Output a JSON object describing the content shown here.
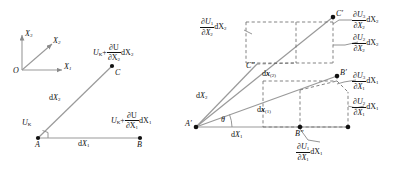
{
  "figure": {
    "background_color": "#ffffff",
    "line_color": "#808080",
    "dash_color": "#555555",
    "text_color": "#111111"
  },
  "axes": {
    "origin_label": "O",
    "x1_label": "X",
    "x1_sub": "1",
    "x2_label": "X",
    "x2_sub": "2",
    "x3_label": "X",
    "x3_sub": "3"
  },
  "left_diagram": {
    "points": [
      {
        "name": "point-a",
        "label": "A",
        "x": 38,
        "y": 138
      },
      {
        "name": "point-b",
        "label": "B",
        "x": 140,
        "y": 138
      },
      {
        "name": "point-c",
        "label": "C",
        "x": 112,
        "y": 66
      }
    ],
    "edges": [
      {
        "name": "edge-ab",
        "label_prefix": "d",
        "label_var": "X",
        "label_sub": "1"
      },
      {
        "name": "edge-ac",
        "label_prefix": "d",
        "label_var": "X",
        "label_sub": "2"
      }
    ],
    "displacement_at_a": {
      "var": "U",
      "sub": "K"
    },
    "displacement_at_c": {
      "base_var": "U",
      "base_sub": "K",
      "plus": "+",
      "num_top": "∂U",
      "num_bottom": "∂X",
      "num_bottom_sub": "2",
      "tail": "dX",
      "tail_sub": "2"
    },
    "displacement_at_b": {
      "base_var": "U",
      "base_sub": "K",
      "plus": "+",
      "num_top": "∂U",
      "num_bottom": "∂X",
      "num_bottom_sub": "1",
      "tail": "dX",
      "tail_sub": "1"
    },
    "right_angle_marker": true
  },
  "right_diagram": {
    "points": [
      {
        "name": "point-a-prime",
        "label": "A′",
        "x": 196,
        "y": 127
      },
      {
        "name": "point-b-prime",
        "label": "B′",
        "x": 337,
        "y": 76
      },
      {
        "name": "point-b-double-prime",
        "label": "B″",
        "x": 300,
        "y": 128
      },
      {
        "name": "point-c-prime",
        "label": "C′",
        "x": 333,
        "y": 17
      },
      {
        "name": "point-c-double-prime",
        "label": "C″",
        "x": 257,
        "y": 64
      },
      {
        "name": "point-corner-lower-right",
        "label": "",
        "x": 348,
        "y": 128
      }
    ],
    "angle": {
      "name": "theta",
      "symbol": "θ"
    },
    "edge_labels": [
      {
        "name": "label-dX1",
        "prefix": "d",
        "var": "X",
        "sub": "1"
      },
      {
        "name": "label-dX2",
        "prefix": "d",
        "var": "X",
        "sub": "2"
      },
      {
        "name": "label-dx1-vector",
        "prefix": "d",
        "var": "x",
        "sub": "(1)",
        "bold": true
      },
      {
        "name": "label-dx2-vector",
        "prefix": "d",
        "var": "x",
        "sub": "(2)",
        "bold": true
      }
    ],
    "gradient_labels": [
      {
        "name": "grad-u1-x2",
        "num": "∂U",
        "num_sub": "1",
        "den": "∂X",
        "den_sub": "2",
        "tail": "dX",
        "tail_sub": "2",
        "position": "upper-left"
      },
      {
        "name": "grad-u3-x2",
        "num": "∂U",
        "num_sub": "3",
        "den": "∂X",
        "den_sub": "2",
        "tail": "dX",
        "tail_sub": "2",
        "position": "upper-right-top"
      },
      {
        "name": "grad-u2-x2",
        "num": "∂U",
        "num_sub": "2",
        "den": "∂X",
        "den_sub": "2",
        "tail": "dX",
        "tail_sub": "2",
        "position": "upper-right-bottom"
      },
      {
        "name": "grad-u3-x1",
        "num": "∂U",
        "num_sub": "3",
        "den": "∂X",
        "den_sub": "1",
        "tail": "dX",
        "tail_sub": "1",
        "position": "lower-right-top"
      },
      {
        "name": "grad-u2-x1",
        "num": "∂U",
        "num_sub": "2",
        "den": "∂X",
        "den_sub": "1",
        "tail": "dX",
        "tail_sub": "1",
        "position": "lower-right-bottom"
      },
      {
        "name": "grad-u1-x1",
        "num": "∂U",
        "num_sub": "1",
        "den": "∂X",
        "den_sub": "1",
        "tail": "dX",
        "tail_sub": "1",
        "position": "bottom-center"
      }
    ]
  }
}
